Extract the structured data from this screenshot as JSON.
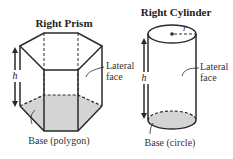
{
  "prism": {
    "title": "Right Prism",
    "height_label": "h",
    "lateral_label_line1": "Lateral",
    "lateral_label_line2": "face",
    "base_label": "Base (polygon)"
  },
  "cylinder": {
    "title": "Right Cylinder",
    "radius_label": "r",
    "height_label": "h",
    "lateral_label_line1": "Lateral",
    "lateral_label_line2": "face",
    "base_label": "Base (circle)"
  },
  "colors": {
    "stroke": "#2a2a2a",
    "base_fill": "#d4d4d4",
    "text": "#222222"
  }
}
